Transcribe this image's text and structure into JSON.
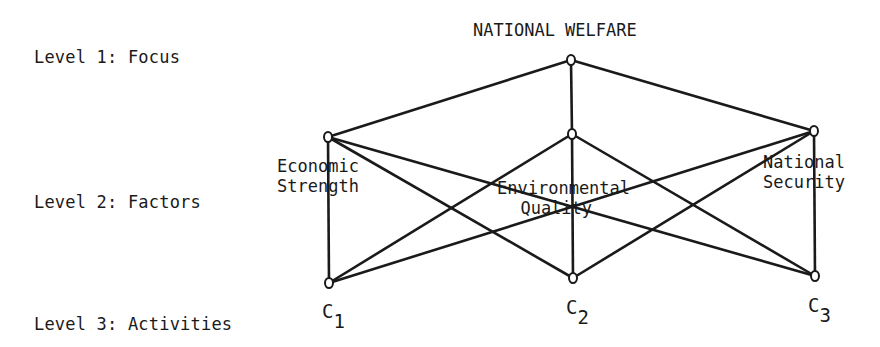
{
  "levels": [
    {
      "label": "Level 1: Focus"
    },
    {
      "label": "Level 2: Factors"
    },
    {
      "label": "Level 3: Activities"
    }
  ],
  "nodes": {
    "focus": {
      "label": "NATIONAL WELFARE"
    },
    "factors": [
      {
        "line1": "Economic",
        "line2": "Strength"
      },
      {
        "line1": "Environmental",
        "line2": "Quality"
      },
      {
        "line1": "National",
        "line2": "Security"
      }
    ],
    "activities": [
      {
        "letter": "C",
        "sub": "1"
      },
      {
        "letter": "C",
        "sub": "2"
      },
      {
        "letter": "C",
        "sub": "3"
      }
    ]
  },
  "edges": [
    [
      "focus",
      "Economic Strength"
    ],
    [
      "focus",
      "Environmental Quality"
    ],
    [
      "focus",
      "National Security"
    ],
    [
      "Economic Strength",
      "C1"
    ],
    [
      "Economic Strength",
      "C2"
    ],
    [
      "Economic Strength",
      "C3"
    ],
    [
      "Environmental Quality",
      "C1"
    ],
    [
      "Environmental Quality",
      "C2"
    ],
    [
      "Environmental Quality",
      "C3"
    ],
    [
      "National Security",
      "C1"
    ],
    [
      "National Security",
      "C2"
    ],
    [
      "National Security",
      "C3"
    ]
  ]
}
